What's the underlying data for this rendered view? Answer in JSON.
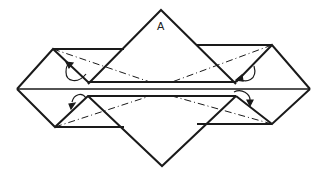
{
  "diagram": {
    "type": "origami-fold-diagram",
    "labels": {
      "top_flap": "A"
    },
    "colors": {
      "line": "#1a1a1a",
      "background": "#ffffff"
    }
  }
}
